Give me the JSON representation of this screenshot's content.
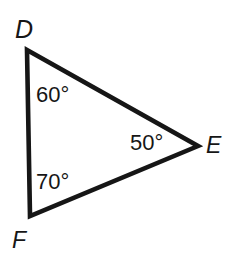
{
  "figure": {
    "kind": "geometry-diagram",
    "shape_name": "triangle",
    "background_color": "#ffffff",
    "stroke_color": "#161616",
    "stroke_width": 4.6,
    "width": 236,
    "height": 260
  },
  "vertices": [
    {
      "id": "D",
      "label": "D",
      "x": 27,
      "y": 50
    },
    {
      "id": "E",
      "label": "E",
      "x": 198,
      "y": 146
    },
    {
      "id": "F",
      "label": "F",
      "x": 30,
      "y": 216
    }
  ],
  "angles": [
    {
      "at": "D",
      "label": "60°",
      "value": 60,
      "unit": "degrees"
    },
    {
      "at": "E",
      "label": "50°",
      "value": 50,
      "unit": "degrees"
    },
    {
      "at": "F",
      "label": "70°",
      "value": 70,
      "unit": "degrees"
    }
  ],
  "sides": [
    {
      "from": "D",
      "to": "E"
    },
    {
      "from": "E",
      "to": "F"
    },
    {
      "from": "F",
      "to": "D"
    }
  ],
  "chart_data": {
    "type": "diagram",
    "title": "",
    "categories": [
      "D",
      "E",
      "F"
    ],
    "values": [
      60,
      50,
      70
    ],
    "xlabel": "",
    "ylabel": "",
    "annotations": [
      "60°",
      "50°",
      "70°"
    ]
  }
}
